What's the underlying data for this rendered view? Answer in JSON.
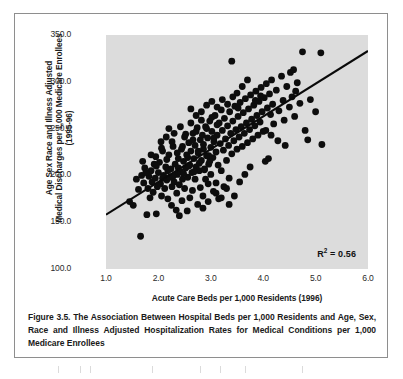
{
  "figure": {
    "caption": "Figure 3.5. The Association Between Hospital Beds per 1,000 Residents and Age, Sex, Race and Illness Adjusted Hospitalization Rates for Medical Conditions per 1,000 Medicare Enrollees",
    "frame_color": "#8e8e8e",
    "panel_color": "#dcdcdc",
    "marker_color": "#0d0d0d",
    "line_color": "#0a0a0a"
  },
  "chart_data": {
    "type": "scatter",
    "title": "",
    "xlabel": "Acute Care Beds per 1,000 Residents (1996)",
    "ylabel_line1": "Age Sex Race and Illness Adjusted",
    "ylabel_line2": "Medical Discharges per 1,000 Medicare Enrollees",
    "ylabel_line3": "(1995-96)",
    "xlim": [
      1.0,
      6.0
    ],
    "ylim": [
      100.0,
      350.0
    ],
    "xticks": [
      "1.0",
      "2.0",
      "3.0",
      "4.0",
      "5.0",
      "6.0"
    ],
    "xtick_values": [
      1.0,
      2.0,
      3.0,
      4.0,
      5.0,
      6.0
    ],
    "yticks": [
      "100.0",
      "150.0",
      "200.0",
      "250.0",
      "300.0",
      "350.0"
    ],
    "ytick_values": [
      100.0,
      150.0,
      200.0,
      250.0,
      300.0,
      350.0
    ],
    "grid": false,
    "legend": "none",
    "annotations": [
      {
        "name": "r-squared",
        "text_prefix": "R",
        "text_sup": "2",
        "text_suffix": " = 0.56",
        "value": 0.56
      }
    ],
    "trendline": {
      "type": "linear",
      "x_start": 1.0,
      "y_start": 158.0,
      "x_end": 6.0,
      "y_end": 333.0,
      "slope": 35.0,
      "intercept": 123.0
    },
    "points": [
      [
        1.45,
        172
      ],
      [
        1.52,
        168
      ],
      [
        1.58,
        196
      ],
      [
        1.62,
        185
      ],
      [
        1.66,
        135
      ],
      [
        1.68,
        200
      ],
      [
        1.72,
        192
      ],
      [
        1.74,
        208
      ],
      [
        1.78,
        158
      ],
      [
        1.8,
        186
      ],
      [
        1.82,
        199
      ],
      [
        1.84,
        176
      ],
      [
        1.86,
        205
      ],
      [
        1.88,
        193
      ],
      [
        1.9,
        182
      ],
      [
        1.92,
        212
      ],
      [
        1.94,
        197
      ],
      [
        1.96,
        159
      ],
      [
        1.98,
        188
      ],
      [
        2.0,
        203
      ],
      [
        2.02,
        214
      ],
      [
        2.04,
        191
      ],
      [
        2.06,
        178
      ],
      [
        2.08,
        226
      ],
      [
        2.1,
        200
      ],
      [
        2.12,
        186
      ],
      [
        2.14,
        209
      ],
      [
        2.16,
        195
      ],
      [
        2.18,
        175
      ],
      [
        2.2,
        222
      ],
      [
        2.22,
        198
      ],
      [
        2.24,
        207
      ],
      [
        2.26,
        188
      ],
      [
        2.28,
        231
      ],
      [
        2.3,
        193
      ],
      [
        2.32,
        212
      ],
      [
        2.34,
        163
      ],
      [
        2.36,
        201
      ],
      [
        2.38,
        218
      ],
      [
        2.4,
        157
      ],
      [
        2.4,
        190
      ],
      [
        2.42,
        204
      ],
      [
        2.44,
        228
      ],
      [
        2.46,
        196
      ],
      [
        2.48,
        215
      ],
      [
        2.5,
        241
      ],
      [
        2.5,
        186
      ],
      [
        2.52,
        208
      ],
      [
        2.54,
        222
      ],
      [
        2.56,
        198
      ],
      [
        2.58,
        235
      ],
      [
        2.6,
        211
      ],
      [
        2.6,
        176
      ],
      [
        2.62,
        226
      ],
      [
        2.64,
        203
      ],
      [
        2.66,
        245
      ],
      [
        2.68,
        218
      ],
      [
        2.7,
        196
      ],
      [
        2.7,
        232
      ],
      [
        2.72,
        209
      ],
      [
        2.74,
        251
      ],
      [
        2.76,
        224
      ],
      [
        2.78,
        205
      ],
      [
        2.8,
        238
      ],
      [
        2.8,
        187
      ],
      [
        2.82,
        216
      ],
      [
        2.84,
        243
      ],
      [
        2.86,
        228
      ],
      [
        2.88,
        207
      ],
      [
        2.9,
        252
      ],
      [
        2.9,
        196
      ],
      [
        2.92,
        221
      ],
      [
        2.94,
        240
      ],
      [
        2.96,
        212
      ],
      [
        2.98,
        258
      ],
      [
        3.0,
        230
      ],
      [
        3.0,
        201
      ],
      [
        3.02,
        247
      ],
      [
        3.04,
        219
      ],
      [
        3.06,
        236
      ],
      [
        3.08,
        264
      ],
      [
        3.1,
        225
      ],
      [
        3.1,
        192
      ],
      [
        3.12,
        243
      ],
      [
        3.14,
        211
      ],
      [
        3.16,
        256
      ],
      [
        3.18,
        234
      ],
      [
        3.2,
        270
      ],
      [
        3.2,
        205
      ],
      [
        3.22,
        248
      ],
      [
        3.24,
        227
      ],
      [
        3.26,
        261
      ],
      [
        3.28,
        239
      ],
      [
        3.3,
        216
      ],
      [
        3.32,
        253
      ],
      [
        3.34,
        232
      ],
      [
        3.36,
        268
      ],
      [
        3.38,
        245
      ],
      [
        3.4,
        322
      ],
      [
        3.4,
        223
      ],
      [
        3.42,
        258
      ],
      [
        3.44,
        237
      ],
      [
        3.46,
        274
      ],
      [
        3.48,
        249
      ],
      [
        3.5,
        228
      ],
      [
        3.52,
        263
      ],
      [
        3.54,
        241
      ],
      [
        3.56,
        278
      ],
      [
        3.58,
        252
      ],
      [
        3.6,
        231
      ],
      [
        3.62,
        267
      ],
      [
        3.64,
        245
      ],
      [
        3.66,
        282
      ],
      [
        3.68,
        256
      ],
      [
        3.7,
        235
      ],
      [
        3.72,
        271
      ],
      [
        3.74,
        249
      ],
      [
        3.76,
        286
      ],
      [
        3.78,
        260
      ],
      [
        3.8,
        239
      ],
      [
        3.82,
        275
      ],
      [
        3.84,
        253
      ],
      [
        3.86,
        290
      ],
      [
        3.88,
        264
      ],
      [
        3.9,
        243
      ],
      [
        3.92,
        279
      ],
      [
        3.94,
        257
      ],
      [
        3.96,
        294
      ],
      [
        3.98,
        268
      ],
      [
        4.0,
        247
      ],
      [
        4.02,
        283
      ],
      [
        4.04,
        215
      ],
      [
        4.06,
        298
      ],
      [
        4.08,
        272
      ],
      [
        4.1,
        218
      ],
      [
        4.12,
        287
      ],
      [
        4.14,
        265
      ],
      [
        4.16,
        302
      ],
      [
        4.18,
        276
      ],
      [
        4.2,
        255
      ],
      [
        4.25,
        291
      ],
      [
        4.3,
        269
      ],
      [
        4.35,
        306
      ],
      [
        4.38,
        280
      ],
      [
        4.4,
        259
      ],
      [
        4.45,
        295
      ],
      [
        4.5,
        273
      ],
      [
        4.52,
        310
      ],
      [
        4.55,
        284
      ],
      [
        4.58,
        313
      ],
      [
        4.6,
        263
      ],
      [
        4.65,
        299
      ],
      [
        4.7,
        277
      ],
      [
        4.75,
        332
      ],
      [
        4.8,
        248
      ],
      [
        4.85,
        238
      ],
      [
        4.9,
        281
      ],
      [
        5.0,
        268
      ],
      [
        5.1,
        331
      ],
      [
        5.12,
        233
      ],
      [
        1.95,
        220
      ],
      [
        2.05,
        236
      ],
      [
        2.15,
        241
      ],
      [
        2.25,
        168
      ],
      [
        2.35,
        181
      ],
      [
        2.45,
        173
      ],
      [
        2.55,
        162
      ],
      [
        2.65,
        184
      ],
      [
        2.75,
        169
      ],
      [
        2.85,
        178
      ],
      [
        2.95,
        191
      ],
      [
        3.05,
        183
      ],
      [
        3.15,
        175
      ],
      [
        3.25,
        188
      ],
      [
        3.35,
        197
      ],
      [
        2.2,
        250
      ],
      [
        2.3,
        245
      ],
      [
        2.42,
        252
      ],
      [
        2.52,
        244
      ],
      [
        2.62,
        256
      ],
      [
        2.72,
        247
      ],
      [
        2.82,
        259
      ],
      [
        2.92,
        250
      ],
      [
        3.02,
        262
      ],
      [
        3.12,
        254
      ],
      [
        1.7,
        215
      ],
      [
        1.76,
        203
      ],
      [
        1.86,
        222
      ],
      [
        1.96,
        210
      ],
      [
        2.06,
        229
      ],
      [
        2.16,
        217
      ],
      [
        2.26,
        236
      ],
      [
        2.36,
        224
      ],
      [
        2.46,
        231
      ],
      [
        2.56,
        219
      ],
      [
        2.66,
        238
      ],
      [
        2.76,
        226
      ],
      [
        2.86,
        233
      ],
      [
        2.96,
        221
      ],
      [
        3.06,
        240
      ],
      [
        2.08,
        197
      ],
      [
        2.18,
        205
      ],
      [
        2.28,
        199
      ],
      [
        2.38,
        208
      ],
      [
        2.48,
        202
      ],
      [
        2.58,
        210
      ],
      [
        2.68,
        204
      ],
      [
        2.78,
        213
      ],
      [
        2.88,
        206
      ],
      [
        2.98,
        215
      ],
      [
        3.3,
        186
      ],
      [
        3.45,
        178
      ],
      [
        3.55,
        193
      ],
      [
        3.65,
        201
      ],
      [
        3.75,
        209
      ],
      [
        3.2,
        176
      ],
      [
        3.35,
        169
      ],
      [
        3.1,
        181
      ],
      [
        2.95,
        172
      ],
      [
        2.85,
        165
      ],
      [
        3.5,
        288
      ],
      [
        3.6,
        295
      ],
      [
        3.7,
        302
      ],
      [
        3.85,
        280
      ],
      [
        3.95,
        285
      ],
      [
        4.05,
        248
      ],
      [
        4.15,
        243
      ],
      [
        4.28,
        237
      ],
      [
        4.42,
        232
      ],
      [
        4.62,
        290
      ],
      [
        2.62,
        271
      ],
      [
        2.72,
        264
      ],
      [
        2.82,
        268
      ],
      [
        2.92,
        275
      ],
      [
        3.02,
        279
      ],
      [
        3.12,
        273
      ],
      [
        3.22,
        281
      ],
      [
        3.32,
        276
      ],
      [
        3.42,
        284
      ],
      [
        3.52,
        272
      ]
    ]
  }
}
